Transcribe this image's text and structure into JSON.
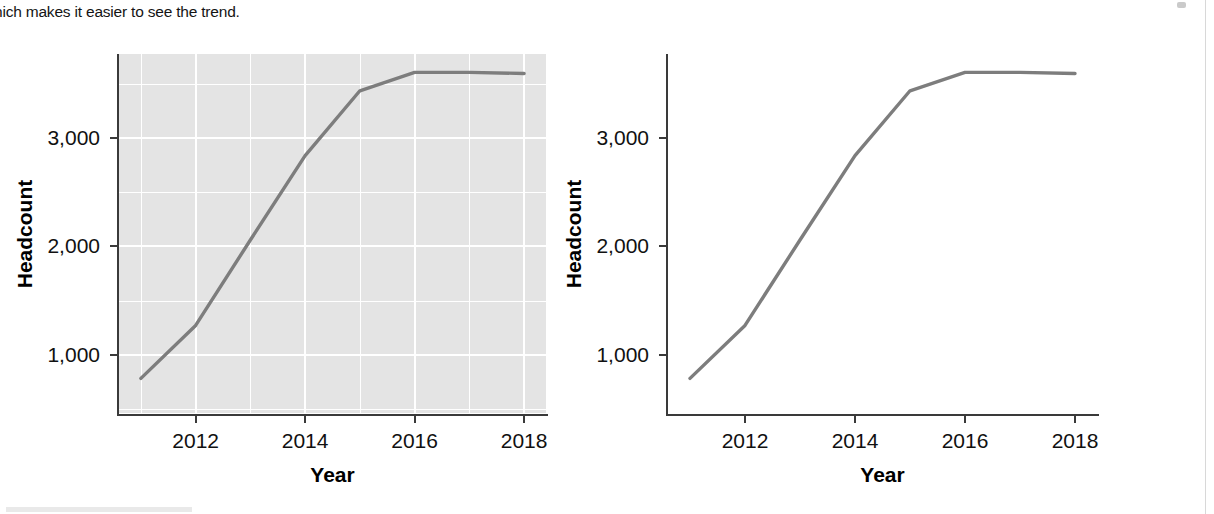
{
  "document": {
    "paragraph_fragment": "hich makes it easier to see the trend."
  },
  "figures": [
    {
      "id": "chart-with-gridlines",
      "panel_background": "#e4e4e4",
      "gridlines_visible": true,
      "chart_data": {
        "type": "line",
        "title": "",
        "xlabel": "Year",
        "ylabel": "Headcount",
        "x": [
          2011,
          2012,
          2013,
          2014,
          2015,
          2016,
          2017,
          2018
        ],
        "values": [
          780,
          1270,
          2060,
          2840,
          3440,
          3610,
          3610,
          3600
        ],
        "xticks": [
          2012,
          2014,
          2016,
          2018
        ],
        "xtick_labels": [
          "2012",
          "2014",
          "2016",
          "2018"
        ],
        "yticks": [
          1000,
          2000,
          3000
        ],
        "ytick_labels": [
          "1,000",
          "2,000",
          "3,000"
        ],
        "xlim": [
          2010.6,
          2018.4
        ],
        "ylim": [
          460,
          3780
        ],
        "grid": true,
        "minor_grid": true,
        "legend": "none",
        "line_color": "#7d7d7d"
      }
    },
    {
      "id": "chart-without-gridlines",
      "panel_background": "#ffffff",
      "gridlines_visible": false,
      "chart_data": {
        "type": "line",
        "title": "",
        "xlabel": "Year",
        "ylabel": "Headcount",
        "x": [
          2011,
          2012,
          2013,
          2014,
          2015,
          2016,
          2017,
          2018
        ],
        "values": [
          780,
          1270,
          2060,
          2840,
          3440,
          3610,
          3610,
          3600
        ],
        "xticks": [
          2012,
          2014,
          2016,
          2018
        ],
        "xtick_labels": [
          "2012",
          "2014",
          "2016",
          "2018"
        ],
        "yticks": [
          1000,
          2000,
          3000
        ],
        "ytick_labels": [
          "1,000",
          "2,000",
          "3,000"
        ],
        "xlim": [
          2010.6,
          2018.4
        ],
        "ylim": [
          460,
          3780
        ],
        "grid": false,
        "minor_grid": false,
        "legend": "none",
        "line_color": "#7d7d7d"
      }
    }
  ]
}
